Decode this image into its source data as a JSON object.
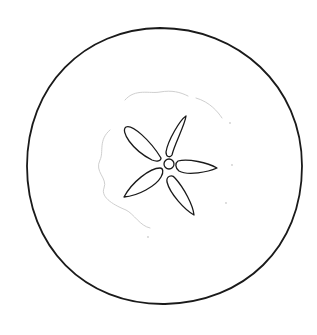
{
  "image": {
    "subject": "apple cross-section line drawing",
    "width": 317,
    "height": 335,
    "background": "#ffffff",
    "stroke_color": "#1a1a1a",
    "faint_stroke_color": "#cfcfcf"
  },
  "outline": {
    "path": "M 160 28 C 238 28 302 86 302 166 C 302 248 244 302 165 304 C 84 305 27 246 27 166 C 27 86 84 29 160 28 Z"
  },
  "core_boundary": {
    "path": "M 125 100 C 135 88 150 94 160 92 C 172 90 180 92 188 96 M 110 130 C 98 140 104 152 100 160 C 94 172 108 178 104 188 C 100 198 116 206 126 210 C 134 214 140 226 150 228 M 196 98 C 210 102 218 112 222 118"
  },
  "seed_cavity": {
    "center": {
      "cx": 169,
      "cy": 164,
      "r": 5
    },
    "petals": [
      {
        "name": "upper-left",
        "path": "M 161 158 C 150 140 132 124 126 127 C 120 131 132 150 152 160 C 157 162 161 161 161 158 Z"
      },
      {
        "name": "upper-right",
        "path": "M 172 155 C 174 145 185 125 186 116 C 180 120 168 140 166 152 C 166 157 170 158 172 155 Z"
      },
      {
        "name": "right",
        "path": "M 178 161 C 188 158 208 163 217 168 C 208 172 188 176 179 171 C 175 168 175 163 178 161 Z"
      },
      {
        "name": "lower-right",
        "path": "M 175 178 C 172 174 166 176 167 182 C 170 194 185 210 194 215 C 193 205 184 188 175 178 Z"
      },
      {
        "name": "lower-left",
        "path": "M 160 168 C 150 168 132 182 124 197 C 138 196 156 186 161 177 C 164 172 163 168 160 168 Z"
      }
    ]
  },
  "speckles": [
    {
      "cx": 230,
      "cy": 123
    },
    {
      "cx": 232,
      "cy": 165
    },
    {
      "cx": 226,
      "cy": 203
    },
    {
      "cx": 148,
      "cy": 237
    }
  ]
}
